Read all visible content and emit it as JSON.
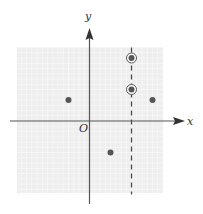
{
  "diagram": {
    "type": "coordinate-plane",
    "axis_labels": {
      "x": "x",
      "y": "y",
      "origin": "O"
    },
    "grid": {
      "xmin": -7,
      "xmax": 7,
      "ymin": -7,
      "ymax": 7,
      "visible": true
    },
    "points": [
      {
        "x": -2,
        "y": 2,
        "circled": false
      },
      {
        "x": 2,
        "y": -3,
        "circled": false
      },
      {
        "x": 4,
        "y": 6,
        "circled": true
      },
      {
        "x": 4,
        "y": 3,
        "circled": true
      },
      {
        "x": 6,
        "y": 2,
        "circled": false
      }
    ],
    "dashed_vertical_line": {
      "x": 4
    },
    "colors": {
      "grid_bg": "#f0f0f0",
      "grid_line": "#ffffff",
      "axis": "#555555",
      "point": "#555555"
    }
  }
}
